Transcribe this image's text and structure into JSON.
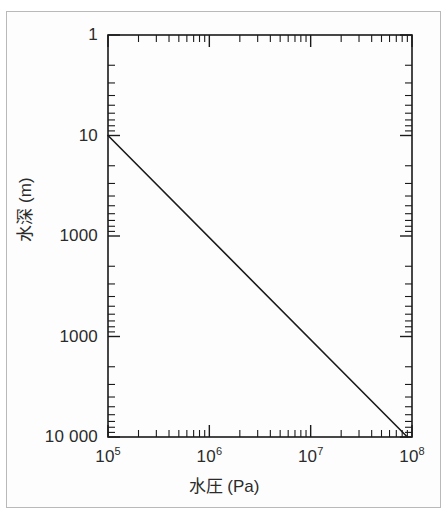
{
  "chart_data": {
    "type": "line",
    "title": "",
    "xlabel": "水圧 (Pa)",
    "ylabel": "水深 (m)",
    "xscale": "log",
    "yscale": "log",
    "y_inverted": true,
    "xlim": [
      100000,
      100000000
    ],
    "ylim": [
      1,
      10000
    ],
    "grid": false,
    "legend": null,
    "xtick_labels": [
      "10",
      "10",
      "10",
      "10"
    ],
    "xtick_exponents": [
      "5",
      "6",
      "7",
      "8"
    ],
    "xtick_values": [
      100000,
      1000000,
      10000000,
      100000000
    ],
    "ytick_labels": [
      "1",
      "10",
      "1000",
      "1000",
      "10 000"
    ],
    "ytick_values": [
      1,
      10,
      100,
      1000,
      10000
    ],
    "series": [
      {
        "name": "水深 vs 水圧",
        "x": [
          100000,
          90000000
        ],
        "y": [
          10,
          10000
        ],
        "color": "#1a1a1a",
        "linewidth": 1.6
      }
    ],
    "annotations": []
  },
  "axes": {
    "x": {
      "title": "水圧 (Pa)",
      "ticks": [
        {
          "label": "10",
          "exp": "5"
        },
        {
          "label": "10",
          "exp": "6"
        },
        {
          "label": "10",
          "exp": "7"
        },
        {
          "label": "10",
          "exp": "8"
        }
      ]
    },
    "y": {
      "title": "水深 (m)",
      "ticks": [
        {
          "label": "1"
        },
        {
          "label": "10"
        },
        {
          "label": "1000"
        },
        {
          "label": "1000"
        },
        {
          "label": "10 000"
        }
      ]
    }
  },
  "colors": {
    "line": "#1a1a1a",
    "frame": "#1a1a1a",
    "outer_border": "#b9b9b9",
    "text": "#2b2b2b",
    "background": "#ffffff"
  }
}
